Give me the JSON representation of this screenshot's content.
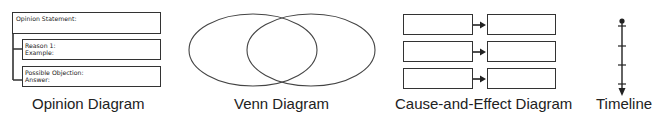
{
  "diagrams": [
    {
      "id": "opinion",
      "label": "Opinion Diagram",
      "boxes": [
        {
          "lines": [
            "Opinion Statement:"
          ]
        },
        {
          "lines": [
            "Reason 1:",
            "Example:"
          ]
        },
        {
          "lines": [
            "Possible Objection:",
            "Answer:"
          ]
        }
      ]
    },
    {
      "id": "venn",
      "label": "Venn Diagram",
      "circles": 2
    },
    {
      "id": "cause-effect",
      "label": "Cause-and-Effect Diagram",
      "rows": 3
    },
    {
      "id": "timeline",
      "label": "Timeline",
      "ticks": 4
    }
  ],
  "colors": {
    "stroke": "#333333",
    "text": "#222222",
    "background": "#ffffff"
  }
}
